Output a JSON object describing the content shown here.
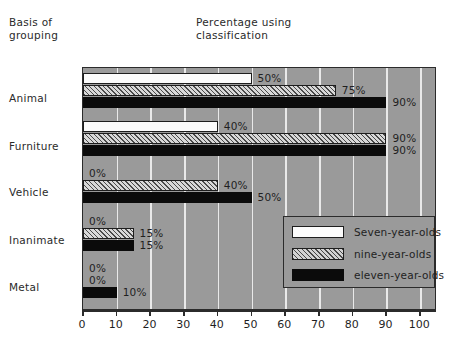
{
  "headings": {
    "basis": "Basis of\ngrouping",
    "percentage": "Percentage using\nclassification"
  },
  "colors": {
    "plot_background": "#9a9a9a",
    "gridline": "#e9e9e9",
    "axis": "#2b2b2b",
    "seven_year_olds": "#fbfbfb",
    "nine_year_olds": "#d8d8d8",
    "eleven_year_olds": "#0b0b0b"
  },
  "legend": {
    "position": "inside-lower-right",
    "entries": [
      {
        "label": "Seven-year-olds",
        "style": "white"
      },
      {
        "label": "nine-year-olds",
        "style": "hatch"
      },
      {
        "label": "eleven-year-olds",
        "style": "black"
      }
    ]
  },
  "chart_data": {
    "type": "bar",
    "orientation": "horizontal",
    "title": "Percentage using classification",
    "xlabel": "",
    "ylabel": "Basis of grouping",
    "xlim": [
      0,
      105
    ],
    "ylim": null,
    "grid": true,
    "xticks": [
      0,
      10,
      20,
      30,
      40,
      50,
      60,
      70,
      80,
      90,
      100
    ],
    "xticklabels": [
      "0",
      "10",
      "20",
      "30",
      "40",
      "50",
      "60",
      "70",
      "80",
      "90",
      "100"
    ],
    "categories": [
      "Animal",
      "Furniture",
      "Vehicle",
      "Inanimate",
      "Metal"
    ],
    "series": [
      {
        "name": "Seven-year-olds",
        "style": "white",
        "values": [
          50,
          40,
          0,
          0,
          0
        ],
        "labels": [
          "50%",
          "40%",
          "0%",
          "0%",
          "0%"
        ]
      },
      {
        "name": "nine-year-olds",
        "style": "hatch",
        "values": [
          75,
          90,
          40,
          15,
          0
        ],
        "labels": [
          "75%",
          "90%",
          "40%",
          "15%",
          "0%"
        ]
      },
      {
        "name": "eleven-year-olds",
        "style": "black",
        "values": [
          90,
          90,
          50,
          15,
          10
        ],
        "labels": [
          "90%",
          "90%",
          "50%",
          "15%",
          "10%"
        ]
      }
    ]
  }
}
